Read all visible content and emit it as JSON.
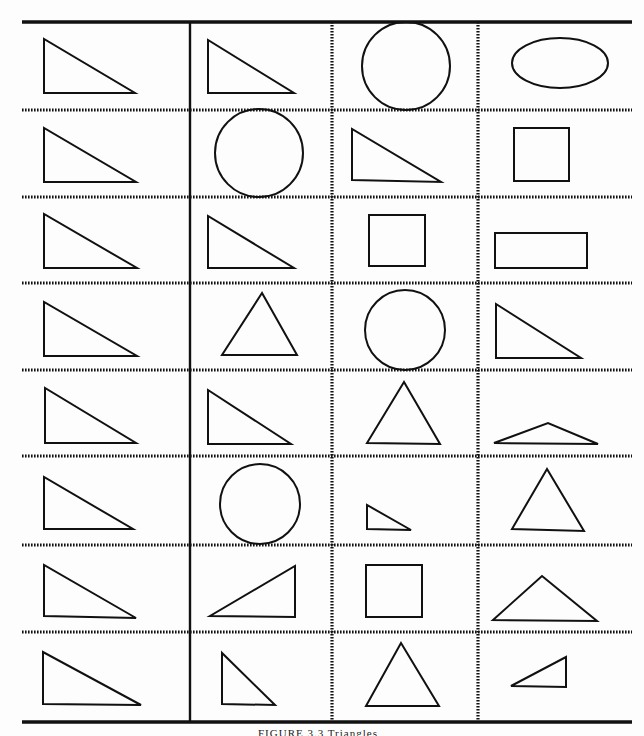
{
  "figure": {
    "caption": "FIGURE 3.3   Triangles",
    "stroke_color": "#111111",
    "background": "#fdfdfd",
    "grid": {
      "left": 22,
      "right": 632,
      "top": 22,
      "bottom": 722,
      "column_dividers": [
        {
          "x": 190,
          "style": "solid"
        },
        {
          "x": 332,
          "style": "dotted"
        },
        {
          "x": 478,
          "style": "dotted"
        }
      ],
      "row_dividers": [
        110,
        197,
        283,
        370,
        456,
        545,
        632
      ]
    },
    "columns": [
      "reference",
      "choice-1",
      "choice-2",
      "choice-3"
    ],
    "rows": [
      {
        "cells": [
          {
            "shape": "right-triangle",
            "points": "44,39 44,93 135,93"
          },
          {
            "shape": "right-triangle",
            "points": "208,40 208,93 294,93"
          },
          {
            "shape": "circle",
            "cx": 406,
            "cy": 66,
            "r": 44
          },
          {
            "shape": "ellipse",
            "cx": 560,
            "cy": 63,
            "rx": 48,
            "ry": 25
          }
        ]
      },
      {
        "cells": [
          {
            "shape": "right-triangle",
            "points": "44,128 44,182 136,182"
          },
          {
            "shape": "circle",
            "cx": 259,
            "cy": 153,
            "r": 44
          },
          {
            "shape": "right-triangle",
            "points": "352,129 352,180 441,182"
          },
          {
            "shape": "rectangle",
            "x": 514,
            "y": 128,
            "w": 55,
            "h": 53
          }
        ]
      },
      {
        "cells": [
          {
            "shape": "right-triangle",
            "points": "44,214 44,268 137,268"
          },
          {
            "shape": "right-triangle",
            "points": "208,216 208,268 294,268"
          },
          {
            "shape": "rectangle",
            "x": 369,
            "y": 215,
            "w": 56,
            "h": 51
          },
          {
            "shape": "rectangle",
            "x": 495,
            "y": 233,
            "w": 92,
            "h": 35
          }
        ]
      },
      {
        "cells": [
          {
            "shape": "right-triangle",
            "points": "44,302 44,356 137,356"
          },
          {
            "shape": "equilateral-triangle",
            "points": "262,293 222,355 297,355"
          },
          {
            "shape": "circle",
            "cx": 405,
            "cy": 330,
            "r": 40
          },
          {
            "shape": "right-triangle",
            "points": "496,304 496,358 581,358"
          }
        ]
      },
      {
        "cells": [
          {
            "shape": "right-triangle",
            "points": "45,388 45,443 136,443"
          },
          {
            "shape": "right-triangle",
            "points": "208,390 208,444 291,444"
          },
          {
            "shape": "equilateral-triangle",
            "points": "404,382 367,443 440,444"
          },
          {
            "shape": "obtuse-triangle",
            "points": "494,443 548,423 598,444"
          }
        ]
      },
      {
        "cells": [
          {
            "shape": "right-triangle",
            "points": "44,477 44,529 133,529"
          },
          {
            "shape": "circle",
            "cx": 260,
            "cy": 504,
            "r": 40
          },
          {
            "shape": "right-triangle",
            "points": "367,505 367,529 411,530"
          },
          {
            "shape": "equilateral-triangle",
            "points": "547,469 512,529 584,531"
          }
        ]
      },
      {
        "cells": [
          {
            "shape": "right-triangle",
            "points": "44,565 44,616 136,618"
          },
          {
            "shape": "right-triangle-mirrored",
            "points": "295,566 295,617 210,616"
          },
          {
            "shape": "rectangle",
            "x": 366,
            "y": 565,
            "w": 56,
            "h": 52
          },
          {
            "shape": "obtuse-triangle",
            "points": "493,620 542,576 597,621"
          }
        ]
      },
      {
        "cells": [
          {
            "shape": "right-triangle",
            "points": "43,652 43,704 141,705"
          },
          {
            "shape": "right-triangle",
            "points": "222,653 222,704 275,705"
          },
          {
            "shape": "equilateral-triangle",
            "points": "401,643 366,706 439,706"
          },
          {
            "shape": "right-triangle-mirrored",
            "points": "566,657 566,687 511,686"
          }
        ]
      }
    ]
  }
}
